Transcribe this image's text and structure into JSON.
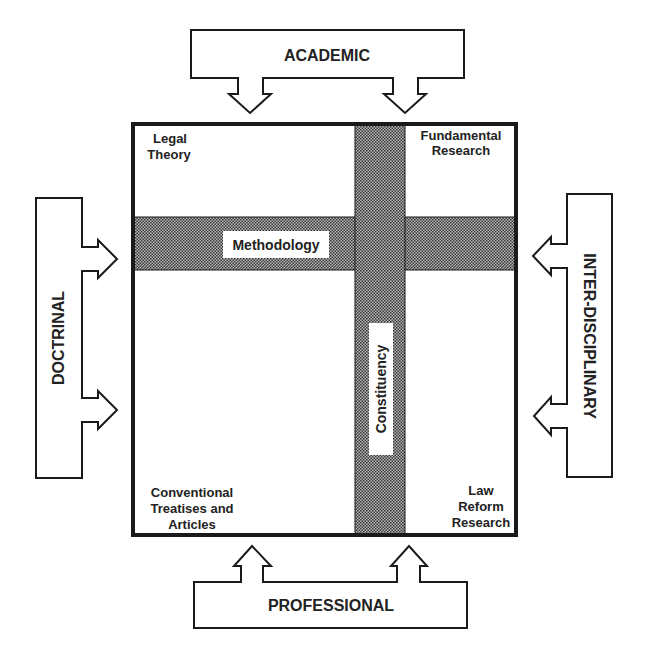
{
  "diagram": {
    "title_fragment": "",
    "influences": {
      "top": "ACADEMIC",
      "bottom": "PROFESSIONAL",
      "left": "DOCTRINAL",
      "right": "INTER-DISCIPLINARY"
    },
    "axes": {
      "horizontal": "Methodology",
      "vertical": "Constituency"
    },
    "quadrants": {
      "top_left": [
        "Legal",
        "Theory"
      ],
      "top_right": [
        "Fundamental",
        "Research"
      ],
      "bottom_left": [
        "Conventional",
        "Treatises and",
        "Articles"
      ],
      "bottom_right": [
        "Law",
        "Reform",
        "Research"
      ]
    },
    "colors": {
      "stroke": "#1a1a1a",
      "band_fill": "#8a8a8a",
      "text": "#222222"
    }
  }
}
